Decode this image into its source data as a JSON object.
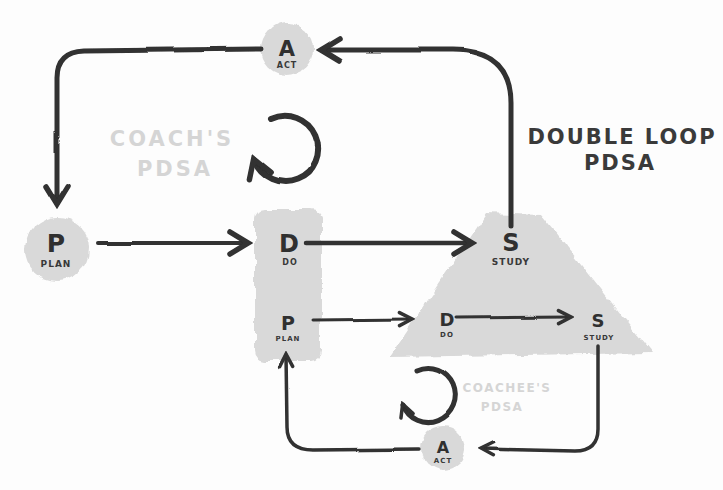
{
  "title": {
    "line1": "DOUBLE LOOP",
    "line2": "PDSA"
  },
  "loops": {
    "coach": {
      "watermark": {
        "line1": "COACH'S",
        "line2": "PDSA"
      },
      "nodes": {
        "plan": {
          "letter": "P",
          "label": "PLAN"
        },
        "do": {
          "letter": "D",
          "label": "DO"
        },
        "study": {
          "letter": "S",
          "label": "STUDY"
        },
        "act": {
          "letter": "A",
          "label": "ACT"
        }
      }
    },
    "coachee": {
      "watermark": {
        "line1": "COACHEE'S",
        "line2": "PDSA"
      },
      "nodes": {
        "plan": {
          "letter": "P",
          "label": "PLAN"
        },
        "do": {
          "letter": "D",
          "label": "DO"
        },
        "study": {
          "letter": "S",
          "label": "STUDY"
        },
        "act": {
          "letter": "A",
          "label": "ACT"
        }
      }
    }
  },
  "icons": {
    "coach_cycle": "cycle-arrow-icon",
    "coachee_cycle": "cycle-arrow-icon"
  },
  "colors": {
    "ink": "#303030",
    "node_fill": "#d9d9d9",
    "watermark": "#d5d5d5",
    "title_text": "#3a3a3a",
    "background": "#fdfdfd"
  }
}
